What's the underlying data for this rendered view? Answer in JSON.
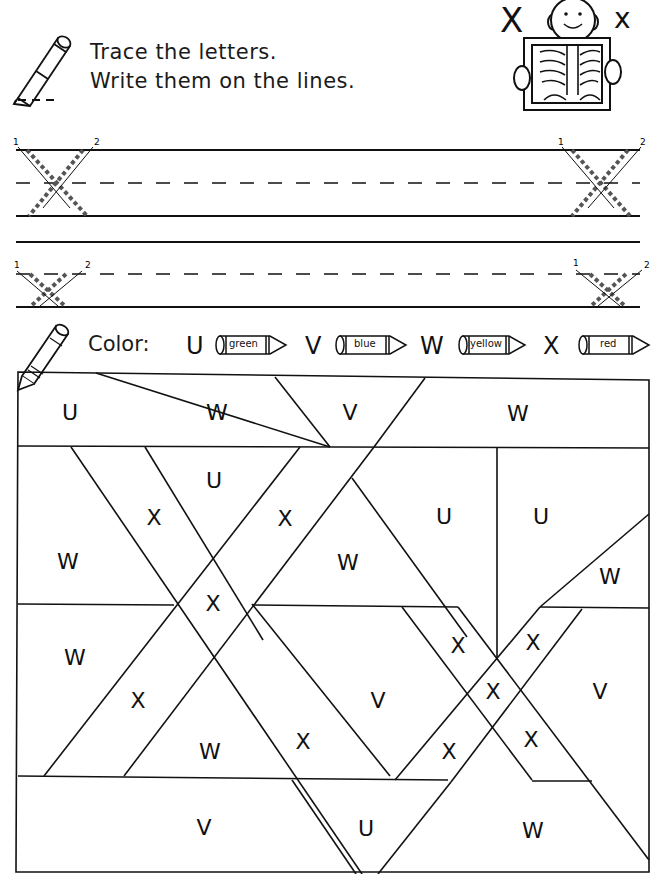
{
  "worksheet": {
    "letter_upper": "X",
    "letter_lower": "x",
    "instructions": [
      "Trace the letters.",
      "Write them on the lines."
    ],
    "tracing": {
      "row1": {
        "stroke_numbers": [
          "1",
          "2",
          "1",
          "2"
        ],
        "letter": "X"
      },
      "row2": {
        "stroke_numbers": [
          "1",
          "2",
          "1",
          "2"
        ],
        "letter": "x"
      }
    },
    "illustration": "child holding x-ray",
    "color_key": {
      "label": "Color:",
      "items": [
        {
          "letter": "U",
          "color": "green",
          "hex": "#2e8b57"
        },
        {
          "letter": "V",
          "color": "blue",
          "hex": "#1f5fbf"
        },
        {
          "letter": "W",
          "color": "yellow",
          "hex": "#f2d21b"
        },
        {
          "letter": "X",
          "color": "red",
          "hex": "#d62828"
        }
      ]
    },
    "puzzle_cells": [
      {
        "letter": "U",
        "x": 70,
        "y": 412
      },
      {
        "letter": "W",
        "x": 217,
        "y": 412
      },
      {
        "letter": "V",
        "x": 350,
        "y": 412
      },
      {
        "letter": "W",
        "x": 518,
        "y": 413
      },
      {
        "letter": "U",
        "x": 214,
        "y": 480
      },
      {
        "letter": "X",
        "x": 154,
        "y": 517
      },
      {
        "letter": "X",
        "x": 285,
        "y": 518
      },
      {
        "letter": "U",
        "x": 444,
        "y": 516
      },
      {
        "letter": "U",
        "x": 541,
        "y": 516
      },
      {
        "letter": "W",
        "x": 68,
        "y": 561
      },
      {
        "letter": "W",
        "x": 348,
        "y": 562
      },
      {
        "letter": "W",
        "x": 610,
        "y": 576
      },
      {
        "letter": "X",
        "x": 213,
        "y": 603
      },
      {
        "letter": "X",
        "x": 458,
        "y": 645
      },
      {
        "letter": "X",
        "x": 533,
        "y": 642
      },
      {
        "letter": "W",
        "x": 75,
        "y": 657
      },
      {
        "letter": "X",
        "x": 493,
        "y": 691
      },
      {
        "letter": "V",
        "x": 600,
        "y": 691
      },
      {
        "letter": "X",
        "x": 138,
        "y": 700
      },
      {
        "letter": "V",
        "x": 378,
        "y": 700
      },
      {
        "letter": "X",
        "x": 303,
        "y": 741
      },
      {
        "letter": "X",
        "x": 531,
        "y": 739
      },
      {
        "letter": "X",
        "x": 449,
        "y": 751
      },
      {
        "letter": "W",
        "x": 210,
        "y": 751
      },
      {
        "letter": "V",
        "x": 204,
        "y": 827
      },
      {
        "letter": "U",
        "x": 366,
        "y": 828
      },
      {
        "letter": "W",
        "x": 533,
        "y": 830
      }
    ]
  }
}
